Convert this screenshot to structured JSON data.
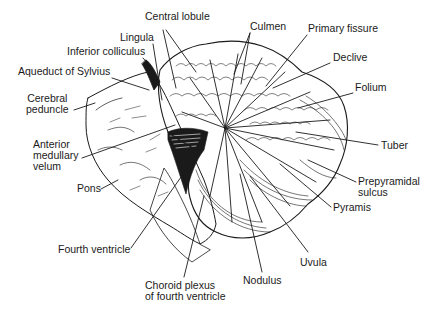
{
  "diagram": {
    "colors": {
      "ink": "#1a1a1a",
      "background": "#ffffff"
    },
    "labels": [
      {
        "id": "central-lobule",
        "text": "Central lobule",
        "x": 145,
        "y": 17,
        "align": "left"
      },
      {
        "id": "culmen",
        "text": "Culmen",
        "x": 250,
        "y": 27,
        "align": "left"
      },
      {
        "id": "primary-fissure",
        "text": "Primary fissure",
        "x": 308,
        "y": 29,
        "align": "left"
      },
      {
        "id": "lingula",
        "text": "Lingula",
        "x": 120,
        "y": 37,
        "align": "left"
      },
      {
        "id": "declive",
        "text": "Declive",
        "x": 333,
        "y": 57,
        "align": "left"
      },
      {
        "id": "inferior-colliculus",
        "text": "Inferior colliculus",
        "x": 67,
        "y": 51,
        "align": "left"
      },
      {
        "id": "aqueduct-of-sylvius",
        "text": "Aqueduct of Sylvius",
        "x": 18,
        "y": 71,
        "align": "left"
      },
      {
        "id": "folium",
        "text": "Folium",
        "x": 355,
        "y": 87,
        "align": "left"
      },
      {
        "id": "cerebral-peduncle",
        "text": "Cerebral\npeduncle",
        "x": 26,
        "y": 98,
        "align": "center"
      },
      {
        "id": "tuber",
        "text": "Tuber",
        "x": 381,
        "y": 139,
        "align": "left"
      },
      {
        "id": "anterior-medullary-velum",
        "text": "Anterior\nmedullary\nvelum",
        "x": 33,
        "y": 139,
        "align": "left"
      },
      {
        "id": "prepyramidal-sulcus",
        "text": "Prepyramidal\nsulcus",
        "x": 358,
        "y": 176,
        "align": "left"
      },
      {
        "id": "pyramis",
        "text": "Pyramis",
        "x": 333,
        "y": 202,
        "align": "left"
      },
      {
        "id": "pons",
        "text": "Pons",
        "x": 77,
        "y": 183,
        "align": "left"
      },
      {
        "id": "fourth-ventricle",
        "text": "Fourth ventricle",
        "x": 58,
        "y": 244,
        "align": "left"
      },
      {
        "id": "uvula",
        "text": "Uvula",
        "x": 300,
        "y": 257,
        "align": "left"
      },
      {
        "id": "nodulus",
        "text": "Nodulus",
        "x": 243,
        "y": 275,
        "align": "left"
      },
      {
        "id": "choroid-plexus",
        "text": "Choroid plexus\nof fourth ventricle",
        "x": 145,
        "y": 280,
        "align": "left"
      }
    ]
  }
}
